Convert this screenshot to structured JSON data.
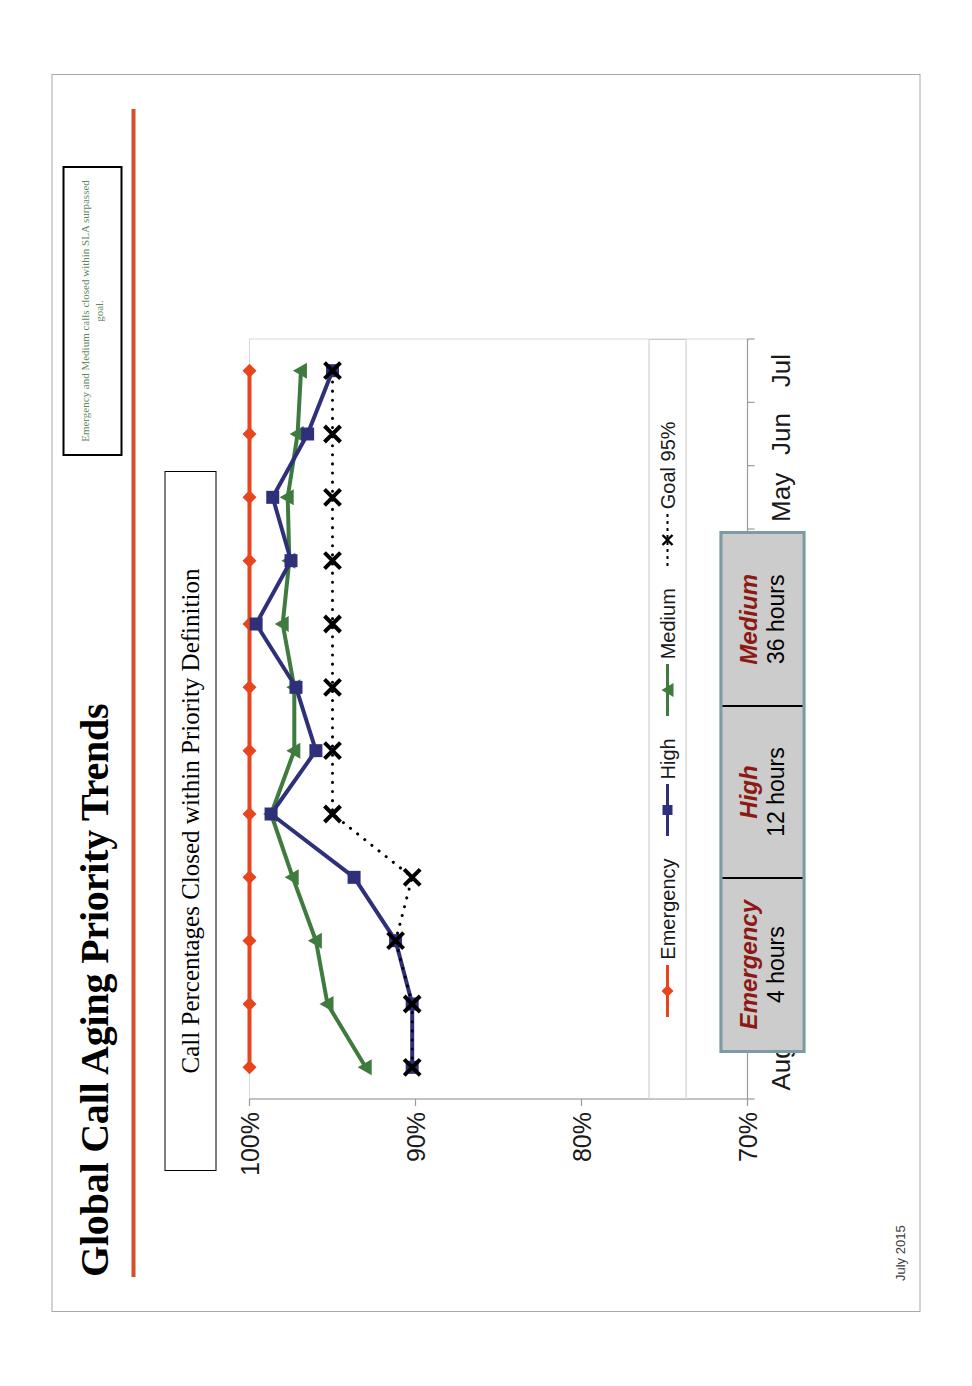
{
  "slide": {
    "title": "Global Call Aging Priority Trends",
    "subtitle": "Call Percentages Closed within Priority Definition",
    "note": "Emergency and Medium calls closed within SLA surpassed goal.",
    "footer": "July 2015",
    "accent_color": "#d1512a",
    "note_text_color": "#5d8a5d"
  },
  "sla_table": {
    "columns": [
      {
        "priority": "Emergency",
        "target": "4 hours"
      },
      {
        "priority": "High",
        "target": "12 hours"
      },
      {
        "priority": "Medium",
        "target": "36 hours"
      }
    ],
    "header_color": "#8c1a14",
    "fill_color": "#cccccc",
    "border_color": "#7d9ba3"
  },
  "chart_data": {
    "type": "line",
    "title": "Call Percentages Closed within Priority Definition",
    "xlabel": "",
    "ylabel": "",
    "categories": [
      "Aug",
      "Sep",
      "Oct",
      "Nov",
      "Dec",
      "Jan",
      "Feb",
      "Mar",
      "Apr",
      "May",
      "Jun",
      "Jul"
    ],
    "ylim": [
      70,
      100
    ],
    "yticks": [
      70,
      80,
      90,
      100
    ],
    "ytick_labels": [
      "70%",
      "80%",
      "90%",
      "100%"
    ],
    "grid": false,
    "legend_position": "bottom",
    "series": [
      {
        "name": "Emergency",
        "color": "#e8451f",
        "marker": "diamond",
        "style": "solid",
        "values": [
          100,
          100,
          100,
          100,
          100,
          100,
          100,
          100,
          100,
          100,
          100,
          100
        ]
      },
      {
        "name": "High",
        "color": "#2e3179",
        "marker": "square",
        "style": "solid",
        "values": [
          90.2,
          90.2,
          91.2,
          93.7,
          98.7,
          96.0,
          97.2,
          99.6,
          97.5,
          98.6,
          96.5,
          95.0
        ]
      },
      {
        "name": "Medium",
        "color": "#3f7a3f",
        "marker": "triangle",
        "style": "solid",
        "values": [
          93.0,
          95.3,
          96.0,
          97.4,
          98.7,
          97.3,
          97.3,
          98.0,
          97.6,
          97.7,
          97.1,
          96.9
        ]
      },
      {
        "name": "Goal 95%",
        "color": "#000000",
        "marker": "x",
        "style": "dotted",
        "values": [
          90.2,
          90.2,
          91.2,
          90.2,
          95.0,
          95.0,
          95.0,
          95.0,
          95.0,
          95.0,
          95.0,
          95.0
        ]
      }
    ]
  }
}
